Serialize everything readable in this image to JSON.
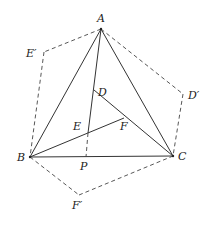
{
  "diagram": {
    "title": "",
    "points": {
      "A": {
        "label": "A",
        "x": 101,
        "y": 29,
        "lx": 97,
        "ly": 22
      },
      "B": {
        "label": "B",
        "x": 30,
        "y": 157,
        "lx": 17,
        "ly": 161
      },
      "C": {
        "label": "C",
        "x": 173,
        "y": 156,
        "lx": 178,
        "ly": 160
      },
      "D": {
        "label": "D",
        "x": 94,
        "y": 90,
        "lx": 98,
        "ly": 96
      },
      "E": {
        "label": "E",
        "x": 88,
        "y": 133,
        "lx": 73,
        "ly": 130
      },
      "F": {
        "label": "F",
        "x": 124,
        "y": 118,
        "lx": 120,
        "ly": 130
      },
      "P": {
        "label": "P",
        "x": 86,
        "y": 157,
        "lx": 80,
        "ly": 170
      },
      "E_prime": {
        "label": "E′",
        "x": 44,
        "y": 52,
        "lx": 26,
        "ly": 57
      },
      "D_prime": {
        "label": "D′",
        "x": 183,
        "y": 94,
        "lx": 188,
        "ly": 99
      },
      "F_prime": {
        "label": "F′",
        "x": 79,
        "y": 195,
        "lx": 72,
        "ly": 209
      }
    },
    "solid_segments": [
      [
        "A",
        "B"
      ],
      [
        "A",
        "C"
      ],
      [
        "B",
        "C"
      ],
      [
        "A",
        "E"
      ],
      [
        "D",
        "C"
      ],
      [
        "B",
        "F"
      ]
    ],
    "dashed_segments": [
      [
        "A",
        "E_prime"
      ],
      [
        "E_prime",
        "B"
      ],
      [
        "A",
        "D_prime"
      ],
      [
        "D_prime",
        "C"
      ],
      [
        "B",
        "F_prime"
      ],
      [
        "F_prime",
        "C"
      ],
      [
        "E",
        "P"
      ]
    ]
  }
}
